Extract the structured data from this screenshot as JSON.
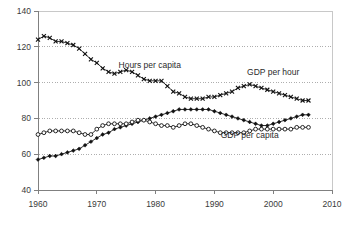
{
  "chart_data": {
    "type": "line",
    "title": "",
    "subtitle": "",
    "xlabel": "",
    "ylabel": "",
    "xlim": [
      1960,
      2010
    ],
    "ylim": [
      40,
      140
    ],
    "xticks": [
      1960,
      1970,
      1980,
      1990,
      2000,
      2010
    ],
    "xtick_labels": [
      "1960",
      "1970",
      "1980",
      "1990",
      "2000",
      "2010"
    ],
    "yticks": [
      40,
      60,
      80,
      100,
      120,
      140
    ],
    "ytick_labels": [
      "40",
      "60",
      "80",
      "100",
      "120",
      "140"
    ],
    "grid": "horizontal-dotted",
    "legend_position": "inline-annotations",
    "x": [
      1960,
      1961,
      1962,
      1963,
      1964,
      1965,
      1966,
      1967,
      1968,
      1969,
      1970,
      1971,
      1972,
      1973,
      1974,
      1975,
      1976,
      1977,
      1978,
      1979,
      1980,
      1981,
      1982,
      1983,
      1984,
      1985,
      1986,
      1987,
      1988,
      1989,
      1990,
      1991,
      1992,
      1993,
      1994,
      1995,
      1996,
      1997,
      1998,
      1999,
      2000,
      2001,
      2002,
      2003,
      2004,
      2005,
      2006
    ],
    "series": [
      {
        "name": "Hours per capita",
        "marker": "cross",
        "label_x": 1979,
        "label_y": 108,
        "values": [
          124,
          126,
          125,
          123,
          123,
          122,
          121,
          119,
          116,
          113,
          111,
          108,
          106,
          105,
          106,
          107,
          106,
          104,
          102,
          101,
          101,
          101,
          98,
          95,
          94,
          92,
          91,
          91,
          91,
          92,
          92,
          93,
          94,
          95,
          97,
          98,
          99,
          98,
          97,
          96,
          95,
          94,
          93,
          92,
          91,
          90,
          90
        ]
      },
      {
        "name": "GDP per hour",
        "marker": "filled-diamond",
        "label_x": 2000,
        "label_y": 104,
        "values": [
          57,
          58,
          59,
          59,
          60,
          61,
          62,
          63,
          65,
          67,
          69,
          71,
          72,
          74,
          75,
          76,
          77,
          78,
          79,
          80,
          81,
          82,
          83,
          84,
          85,
          85,
          85,
          85,
          85,
          85,
          84,
          83,
          82,
          81,
          80,
          79,
          78,
          77,
          76,
          76,
          77,
          78,
          79,
          80,
          81,
          82,
          82
        ]
      },
      {
        "name": "GDP per capita",
        "marker": "open-circle",
        "label_x": 1996,
        "label_y": 69,
        "values": [
          71,
          72,
          73,
          73,
          73,
          73,
          73,
          72,
          71,
          71,
          74,
          76,
          77,
          77,
          77,
          77,
          78,
          79,
          79,
          78,
          77,
          76,
          76,
          75,
          76,
          77,
          77,
          76,
          75,
          74,
          73,
          72,
          72,
          72,
          72,
          72,
          73,
          74,
          74,
          74,
          74,
          74,
          74,
          74,
          75,
          75,
          75
        ]
      }
    ]
  }
}
